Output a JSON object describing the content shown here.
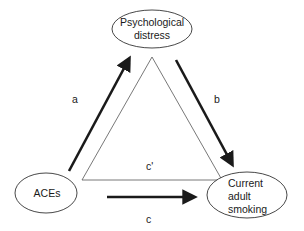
{
  "diagram": {
    "type": "mediation-model",
    "nodes": {
      "mediator": {
        "lines": [
          "Psychological",
          "distress"
        ]
      },
      "exposure": {
        "lines": [
          "ACEs"
        ]
      },
      "outcome": {
        "lines": [
          "Current",
          "adult",
          "smoking"
        ]
      }
    },
    "paths": {
      "a": {
        "label": "a",
        "from": "ACEs",
        "to": "Psychological distress",
        "style": "bold-arrow"
      },
      "b": {
        "label": "b",
        "from": "Psychological distress",
        "to": "Current adult smoking",
        "style": "bold-arrow"
      },
      "c_prime": {
        "label": "c'",
        "from": "ACEs",
        "to": "Current adult smoking",
        "style": "thin-line"
      },
      "c": {
        "label": "c",
        "from": "ACEs",
        "to": "Current adult smoking",
        "style": "bold-arrow"
      }
    },
    "colors": {
      "stroke": "#1a1a1a",
      "background": "#ffffff"
    }
  }
}
